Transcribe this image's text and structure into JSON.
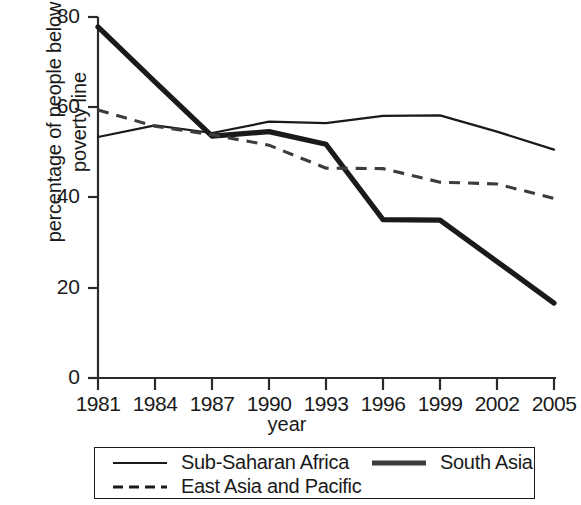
{
  "chart_data": {
    "type": "line",
    "title": "",
    "xlabel": "year",
    "ylabel": "percentage of people below\npoverty line",
    "x": [
      1981,
      1984,
      1987,
      1990,
      1993,
      1996,
      1999,
      2002,
      2005
    ],
    "xtick_labels": [
      "1981",
      "1984",
      "1987",
      "1990",
      "1993",
      "1996",
      "1999",
      "2002",
      "2005"
    ],
    "ytick_labels": [
      "0",
      "20",
      "40",
      "60",
      "80"
    ],
    "yticks": [
      0,
      20,
      40,
      60,
      80
    ],
    "ylim": [
      0,
      80
    ],
    "xlim": [
      1981,
      2005
    ],
    "grid": false,
    "legend_position": "below-axes",
    "series": [
      {
        "name": "Sub-Saharan Africa",
        "style": "solid-thin",
        "color": "#1a1a1a",
        "values": [
          53.4,
          56.0,
          54.3,
          56.8,
          56.5,
          58.1,
          58.2,
          54.6,
          50.6
        ]
      },
      {
        "name": "South Asia",
        "style": "solid-thick",
        "color": "#3c3c3c",
        "values": [
          59.4,
          55.8,
          53.9,
          51.6,
          46.5,
          46.4,
          43.4,
          43.0,
          39.8
        ]
      },
      {
        "name": "East Asia and Pacific",
        "style": "dashed",
        "color": "#1a1a1a",
        "values": [
          77.8,
          65.6,
          53.6,
          54.6,
          51.8,
          35.1,
          35.0,
          25.8,
          16.6
        ]
      }
    ]
  },
  "axes": {
    "x_title": "year"
  },
  "legend": {
    "entries": [
      {
        "label": "Sub-Saharan Africa",
        "style": "solid-thin"
      },
      {
        "label": "East Asia and Pacific",
        "style": "dashed"
      },
      {
        "label": "South Asia",
        "style": "solid-thick"
      }
    ]
  }
}
